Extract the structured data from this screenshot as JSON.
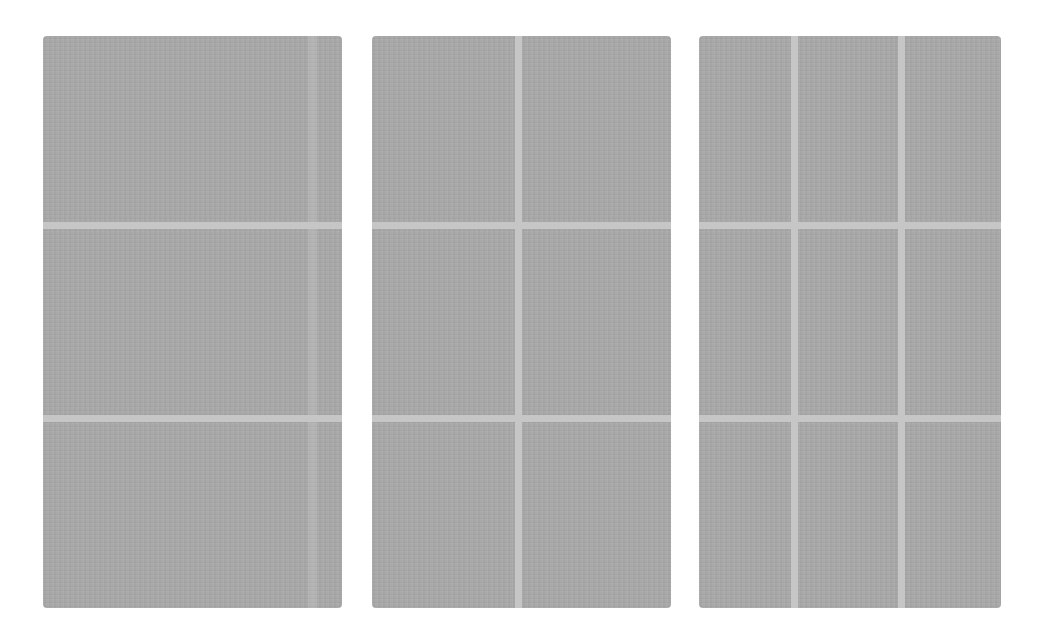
{
  "panels": [
    {
      "name": "panel-one-column",
      "columns": 1,
      "rows": 3
    },
    {
      "name": "panel-two-columns",
      "columns": 2,
      "rows": 3
    },
    {
      "name": "panel-three-columns",
      "columns": 3,
      "rows": 3
    }
  ],
  "colors": {
    "panel": "#a9a9a9",
    "divider": "#c6c6c6",
    "background": "#ffffff"
  }
}
